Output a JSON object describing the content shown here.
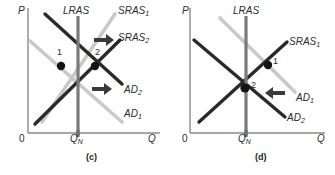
{
  "figure": {
    "background": "#ffffff",
    "width": 335,
    "height": 175
  },
  "colors": {
    "axis": "#8a8a8a",
    "dark_line": "#2a2a2a",
    "light_line": "#c9c9c9",
    "lras_line": "#7a7a7a",
    "arrow": "#3a3a3a",
    "point": "#141414",
    "text": "#2b2b2b"
  },
  "panels": [
    {
      "id": "c",
      "caption": "(c)",
      "axes": {
        "y_label": "P",
        "x_label": "Q",
        "origin_label": "0",
        "x_tick_label": "Q",
        "x_tick_sub": "N"
      },
      "curves": [
        {
          "name": "LRAS",
          "label": "LRAS",
          "sub": "",
          "style": "lras",
          "label_x": 63,
          "label_y": 8
        },
        {
          "name": "SRAS1",
          "label": "SRAS",
          "sub": "1",
          "style": "light",
          "label_x": 118,
          "label_y": 8
        },
        {
          "name": "SRAS2",
          "label": "SRAS",
          "sub": "2",
          "style": "dark",
          "label_x": 118,
          "label_y": 34
        },
        {
          "name": "AD2",
          "label": "AD",
          "sub": "2",
          "style": "dark",
          "label_x": 124,
          "label_y": 86
        },
        {
          "name": "AD1",
          "label": "AD",
          "sub": "1",
          "style": "light",
          "label_x": 124,
          "label_y": 110
        }
      ],
      "points": [
        {
          "label": "1",
          "x": 61,
          "y": 66,
          "label_x": 57,
          "label_y": 50
        },
        {
          "label": "2",
          "x": 95,
          "y": 66,
          "label_x": 96,
          "label_y": 50
        }
      ],
      "arrows": [
        {
          "name": "sras-shift-arrow",
          "direction": "right",
          "x": 95,
          "y": 37
        },
        {
          "name": "ad-shift-arrow",
          "direction": "right",
          "x": 94,
          "y": 88
        }
      ]
    },
    {
      "id": "d",
      "caption": "(d)",
      "axes": {
        "y_label": "P",
        "x_label": "Q",
        "origin_label": "0",
        "x_tick_label": "Q",
        "x_tick_sub": "N"
      },
      "curves": [
        {
          "name": "LRAS",
          "label": "LRAS",
          "sub": "",
          "style": "lras",
          "label_x": 66,
          "label_y": 8
        },
        {
          "name": "SRAS1",
          "label": "SRAS",
          "sub": "1",
          "style": "dark",
          "label_x": 122,
          "label_y": 38
        },
        {
          "name": "AD1",
          "label": "AD",
          "sub": "1",
          "style": "light",
          "label_x": 129,
          "label_y": 94
        },
        {
          "name": "AD2",
          "label": "AD",
          "sub": "2",
          "style": "dark",
          "label_x": 120,
          "label_y": 114
        }
      ],
      "points": [
        {
          "label": "1",
          "x": 101,
          "y": 65,
          "label_x": 105,
          "label_y": 58
        },
        {
          "label": "2",
          "x": 78,
          "y": 88,
          "label_x": 83,
          "label_y": 82
        }
      ],
      "arrows": [
        {
          "name": "ad-shift-arrow",
          "direction": "left",
          "x": 98,
          "y": 93
        }
      ]
    }
  ]
}
